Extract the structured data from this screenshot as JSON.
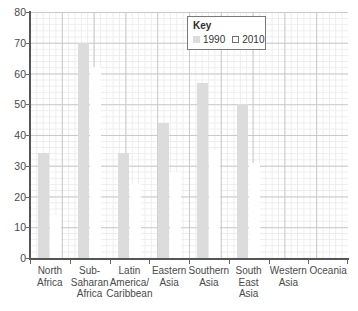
{
  "chart_data": {
    "type": "bar",
    "title": "",
    "xlabel": "",
    "ylabel": "",
    "ylim": [
      0,
      80
    ],
    "ytick_step": 10,
    "yticks": [
      80,
      70,
      60,
      50,
      40,
      30,
      20,
      10,
      0
    ],
    "grid": true,
    "legend_position": "top-right",
    "legend_title": "Key",
    "categories": [
      "North\nAfrica",
      "Sub-\nSaharan\nAfrica",
      "Latin\nAmerica/\nCaribbean",
      "Eastern\nAsia",
      "Southern\nAsia",
      "South\nEast\nAsia",
      "Western\nAsia",
      "Oceania"
    ],
    "series": [
      {
        "name": "1990",
        "color": "#dcdcdc",
        "values": [
          34,
          70,
          34,
          44,
          57,
          50,
          0,
          0
        ]
      },
      {
        "name": "2010",
        "color": "#ffffff",
        "values": [
          14,
          62,
          24,
          28,
          35,
          31,
          0,
          0
        ]
      }
    ]
  },
  "legend": {
    "title": "Key",
    "entries": [
      {
        "label": "1990",
        "swatch": "filled"
      },
      {
        "label": "2010",
        "swatch": "outline"
      }
    ]
  },
  "axis": {
    "y_labels": [
      "80",
      "70",
      "60",
      "50",
      "40",
      "30",
      "20",
      "10",
      "0"
    ]
  }
}
